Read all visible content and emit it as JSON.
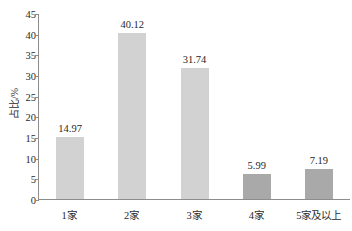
{
  "chart_data": {
    "type": "bar",
    "title": "",
    "subtitle": "",
    "xlabel": "",
    "ylabel": "占比/%",
    "categories": [
      "1家",
      "2家",
      "3家",
      "4家",
      "5家及以上"
    ],
    "values": [
      14.97,
      40.12,
      31.74,
      5.99,
      7.19
    ],
    "value_labels": [
      "14.97",
      "40.12",
      "31.74",
      "5.99",
      "7.19"
    ],
    "ylim": [
      0,
      45
    ],
    "ytick_values": [
      0,
      5,
      10,
      15,
      20,
      25,
      30,
      35,
      40,
      45
    ],
    "ytick_labels": [
      "0",
      "5",
      "10",
      "15",
      "20",
      "25",
      "30",
      "35",
      "40",
      "45"
    ],
    "grid": false,
    "legend": null,
    "legend_position": "none",
    "bar_colors": [
      "#d2d2d2",
      "#d2d2d2",
      "#d2d2d2",
      "#a9a9a9",
      "#a9a9a9"
    ],
    "axis_color": "#8d8d8d",
    "background": "#ffffff"
  }
}
